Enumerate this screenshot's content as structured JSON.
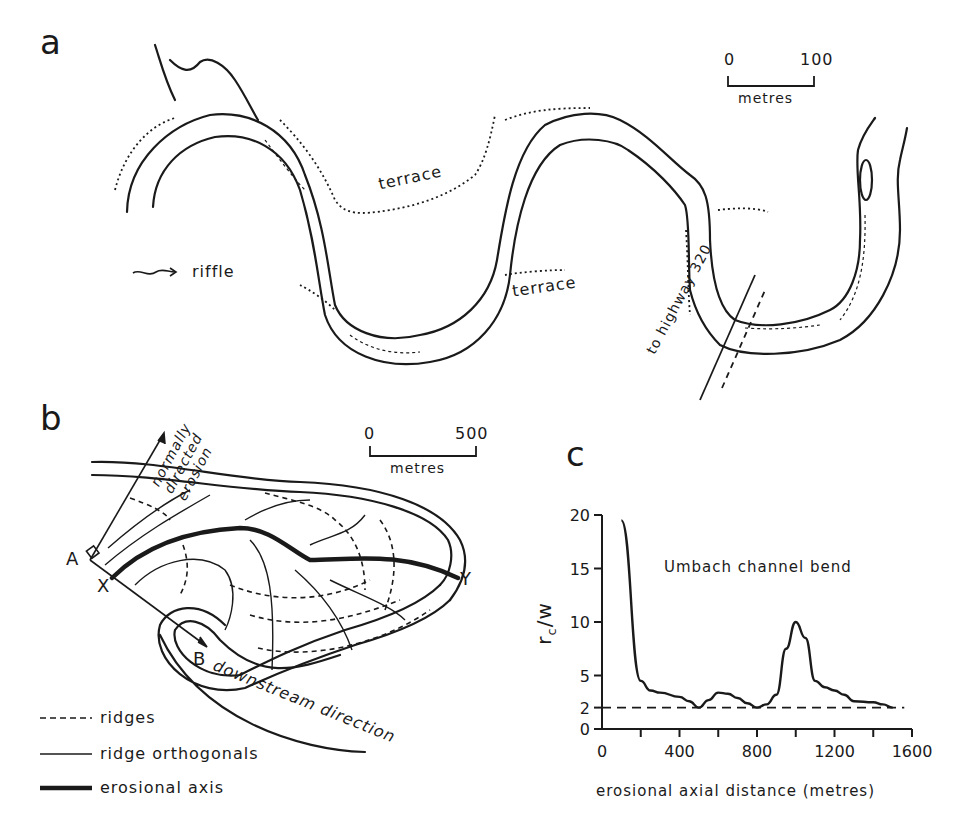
{
  "panels": {
    "a": {
      "label": "a",
      "scale": {
        "start": "0",
        "end": "100",
        "unit": "metres"
      },
      "labels": {
        "terrace_upper": "terrace",
        "terrace_lower": "terrace",
        "riffle_legend": "riffle",
        "highway": "to highway 320"
      }
    },
    "b": {
      "label": "b",
      "scale": {
        "start": "0",
        "end": "500",
        "unit": "metres"
      },
      "points": {
        "A": "A",
        "B": "B",
        "X": "X",
        "Y": "Y"
      },
      "arrows": {
        "normal": "normally directed erosion",
        "downstream": "downstream direction"
      },
      "legend": [
        {
          "style": "dashed",
          "label": "ridges"
        },
        {
          "style": "thin",
          "label": "ridge orthogonals"
        },
        {
          "style": "thick",
          "label": "erosional axis"
        }
      ]
    },
    "c": {
      "label": "c"
    }
  },
  "chart_data": {
    "type": "line",
    "title": "Umbach channel bend",
    "xlabel": "erosional axial distance (metres)",
    "ylabel": "rc/w",
    "xlim": [
      0,
      1600
    ],
    "ylim": [
      0,
      20
    ],
    "xticks": [
      0,
      400,
      800,
      1200,
      1600
    ],
    "yticks": [
      0,
      2,
      5,
      10,
      15,
      20
    ],
    "grid": false,
    "reference_line": {
      "y": 2,
      "style": "dashed"
    },
    "series": [
      {
        "name": "rc/w",
        "x": [
          100,
          200,
          250,
          300,
          400,
          450,
          500,
          550,
          600,
          650,
          700,
          750,
          800,
          850,
          900,
          950,
          1000,
          1050,
          1100,
          1150,
          1200,
          1250,
          1300,
          1400,
          1450,
          1500
        ],
        "y": [
          19.5,
          4.5,
          3.6,
          3.4,
          3.0,
          2.6,
          2.0,
          2.7,
          3.4,
          3.3,
          2.9,
          2.4,
          2.0,
          2.3,
          3.2,
          7.5,
          10.0,
          8.5,
          4.5,
          3.9,
          3.6,
          3.2,
          2.6,
          2.5,
          2.3,
          2.0
        ]
      }
    ]
  }
}
